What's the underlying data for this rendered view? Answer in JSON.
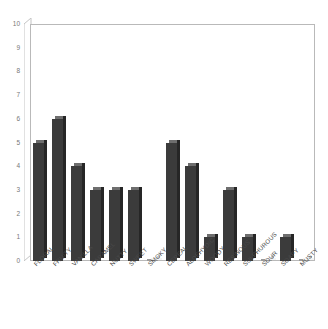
{
  "chart_data": {
    "type": "bar",
    "title": "",
    "subtitle": "",
    "xlabel": "",
    "ylabel": "",
    "categories": [
      "FLORAL",
      "FRUITY",
      "VANILLA",
      "CARAMEL",
      "NUTTY",
      "SWEET",
      "SMOKY",
      "CEREAL",
      "ALDEHYDIC",
      "WOODY",
      "RESINOUS",
      "SULPHUROUS",
      "SOUR",
      "SOAPY",
      "MUSTY"
    ],
    "values": [
      5,
      6,
      4,
      3,
      3,
      3,
      0,
      5,
      4,
      1,
      3,
      1,
      0,
      1,
      0
    ],
    "ylim": [
      0,
      10
    ],
    "ytick_labels": [
      "0",
      "1",
      "2",
      "3",
      "4",
      "5",
      "6",
      "7",
      "8",
      "9",
      "10"
    ],
    "ytick_values": [
      0,
      1,
      2,
      3,
      4,
      5,
      6,
      7,
      8,
      9,
      10
    ],
    "grid": false,
    "legend": false,
    "legend_position": "none",
    "bar_color": "#3b3b3b",
    "bar_side_color": "#262626",
    "bar_top_color": "#6e6e6e",
    "axis_color": "#b9b9b9",
    "tick_label_color": "#777777",
    "category_label_color": "#4a4a4a",
    "background_color": "#ffffff",
    "style": "3d-column",
    "xtick_rotation_degrees": -45
  }
}
